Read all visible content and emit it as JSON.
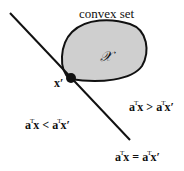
{
  "diagram": {
    "title": "convex set",
    "set_symbol": "𝒳",
    "point_label": "x′",
    "halfspace_left": {
      "a": "a",
      "t": "T",
      "x": "x",
      "op": " < ",
      "a2": "a",
      "t2": "T",
      "x2": "x′"
    },
    "halfspace_right": {
      "a": "a",
      "t": "T",
      "x": "x",
      "op": " > ",
      "a2": "a",
      "t2": "T",
      "x2": "x′"
    },
    "hyperplane": {
      "a": "a",
      "t": "T",
      "x": "x",
      "op": " = ",
      "a2": "a",
      "t2": "T",
      "x2": "x′"
    },
    "colors": {
      "set_fill": "#cfcfcf",
      "stroke": "#111111",
      "background": "#ffffff"
    }
  }
}
